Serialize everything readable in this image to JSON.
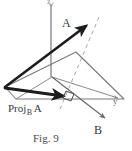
{
  "figure": {
    "caption": "Fig. 9",
    "labels": {
      "vector_a": "A",
      "vector_b": "B",
      "axis_y": "y",
      "axis_z": "z",
      "projection_prefix": "Proj",
      "projection_subscript": "B",
      "projection_main": "A"
    },
    "colors": {
      "vector_stroke": "#1c1c1c",
      "axis_stroke": "#8a8a8a",
      "plane_stroke": "#6a6a6a",
      "dashed_stroke": "#a0a0a0",
      "right_angle_stroke": "#4a4a4a",
      "text": "#3a3a3a",
      "background": "#ffffff"
    },
    "geometry": {
      "origin": [
        52,
        77
      ],
      "z_axis_top": [
        51,
        4
      ],
      "plane_left_vertex": [
        5,
        87
      ],
      "plane_top_vertex": [
        76,
        52
      ],
      "plane_right_vertex": [
        124,
        99
      ],
      "vector_a_tip": [
        89,
        24
      ],
      "vector_a_tail": [
        5,
        87
      ],
      "projection_tail": [
        5,
        90
      ],
      "projection_tip": [
        67,
        98
      ],
      "vector_b_tip": [
        107,
        120
      ],
      "dashed_top": [
        98,
        18
      ],
      "dashed_bottom": [
        60,
        108
      ],
      "right_angle_corner": [
        70,
        97
      ]
    }
  }
}
